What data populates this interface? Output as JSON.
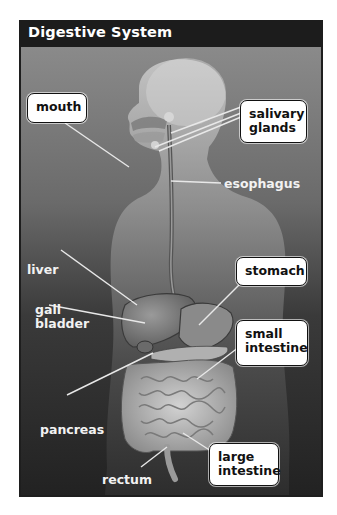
{
  "figure": {
    "title": "Digestive System",
    "colors": {
      "panel_background": "#1e1e1e",
      "label_box": "#ffffff",
      "label_text_on_box": "#111111",
      "label_text_plain": "#f2f2f2",
      "leader_line": "#e8e8e8"
    }
  },
  "labels": {
    "mouth": "mouth",
    "salivary_glands_line1": "salivary",
    "salivary_glands_line2": "glands",
    "esophagus": "esophagus",
    "liver": "liver",
    "gall_bladder_line1": "gall",
    "gall_bladder_line2": "bladder",
    "stomach": "stomach",
    "small_intestine_line1": "small",
    "small_intestine_line2": "intestine",
    "pancreas": "pancreas",
    "large_intestine_line1": "large",
    "large_intestine_line2": "intestine",
    "rectum": "rectum"
  }
}
